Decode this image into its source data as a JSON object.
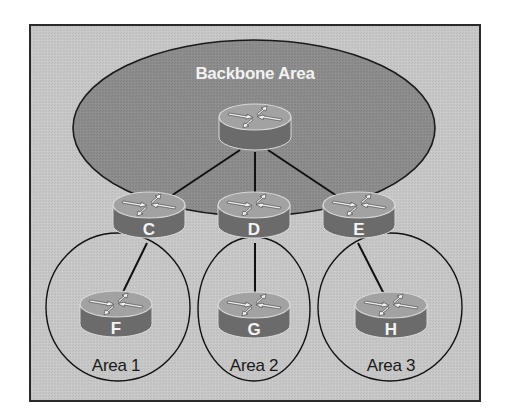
{
  "diagram": {
    "type": "OSPF hierarchical area topology",
    "colors": {
      "page_background": "#ffffff",
      "frame_fill": "#c6c6c6",
      "frame_border": "#2a2a2a",
      "backbone_fill": "#8c8c8c",
      "router_top": "#a2a2a2",
      "router_side": "#6b6b6b",
      "router_rim": "#d8d8d8",
      "link_color": "#111111",
      "area_outline": "#111111",
      "label_dark": "#1a1a1a",
      "label_light": "#f4f4f4"
    },
    "backbone": {
      "label": "Backbone Area"
    },
    "routers": {
      "core": {
        "label": ""
      },
      "C": {
        "label": "C"
      },
      "D": {
        "label": "D"
      },
      "E": {
        "label": "E"
      },
      "F": {
        "label": "F"
      },
      "G": {
        "label": "G"
      },
      "H": {
        "label": "H"
      }
    },
    "areas": [
      {
        "label": "Area 1",
        "border_router": "C",
        "internal_router": "F"
      },
      {
        "label": "Area 2",
        "border_router": "D",
        "internal_router": "G"
      },
      {
        "label": "Area 3",
        "border_router": "E",
        "internal_router": "H"
      }
    ],
    "links": [
      {
        "from": "core",
        "to": "C"
      },
      {
        "from": "core",
        "to": "D"
      },
      {
        "from": "core",
        "to": "E"
      },
      {
        "from": "C",
        "to": "F"
      },
      {
        "from": "D",
        "to": "G"
      },
      {
        "from": "E",
        "to": "H"
      }
    ]
  }
}
